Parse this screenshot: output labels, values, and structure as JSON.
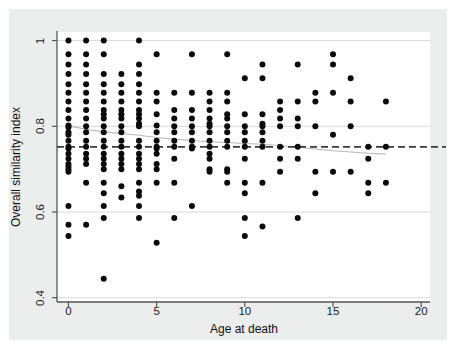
{
  "figure": {
    "background_color": "#eceded",
    "plot_background_color": "#ffffff",
    "axis_color": "#555555",
    "gridline_color": "#d9d9d9",
    "marker_color": "#0b0b0b",
    "reference_line_color": "#3b3b3b",
    "fit_line_color": "#b9b9b9"
  },
  "chart_data": {
    "type": "scatter",
    "title": "",
    "xlabel": "Age at death",
    "ylabel": "Overall similarity index",
    "xlim": [
      -0.65,
      20.5
    ],
    "ylim": [
      0.39,
      1.02
    ],
    "xticks": [
      0,
      5,
      10,
      15,
      20
    ],
    "xtick_labels": [
      "0",
      "5",
      "10",
      "15",
      "20"
    ],
    "yticks": [
      0.4,
      0.6,
      0.8,
      1
    ],
    "ytick_labels": [
      "0.4",
      "0.6",
      "0.8",
      "1"
    ],
    "grid": "horizontal",
    "gridline_values": [
      0.4,
      0.6,
      0.8,
      1.0
    ],
    "legend": "none",
    "marker": "filled-circle",
    "marker_size_px": 6,
    "annotations": [
      {
        "name": "reference-line",
        "type": "horizontal-dashed-line",
        "y": 0.752,
        "style": "dashed"
      },
      {
        "name": "fit-line",
        "type": "lowess-line",
        "style": "solid-thin-gray",
        "points": [
          [
            0.0,
            0.801
          ],
          [
            1.0,
            0.793
          ],
          [
            2.0,
            0.787
          ],
          [
            3.0,
            0.783
          ],
          [
            4.0,
            0.779
          ],
          [
            5.0,
            0.774
          ],
          [
            6.0,
            0.77
          ],
          [
            7.0,
            0.767
          ],
          [
            8.0,
            0.764
          ],
          [
            9.0,
            0.762
          ],
          [
            10.0,
            0.76
          ],
          [
            11.0,
            0.758
          ],
          [
            12.0,
            0.755
          ],
          [
            13.0,
            0.751
          ],
          [
            14.0,
            0.747
          ],
          [
            15.0,
            0.743
          ],
          [
            16.0,
            0.74
          ],
          [
            17.0,
            0.737
          ],
          [
            18.0,
            0.735
          ]
        ]
      }
    ],
    "points": [
      [
        0,
        1.0
      ],
      [
        0,
        0.968
      ],
      [
        0,
        0.944
      ],
      [
        0,
        0.922
      ],
      [
        0,
        0.898
      ],
      [
        0,
        0.878
      ],
      [
        0,
        0.858
      ],
      [
        0,
        0.838
      ],
      [
        0,
        0.818
      ],
      [
        0,
        0.802
      ],
      [
        0,
        0.798
      ],
      [
        0,
        0.786
      ],
      [
        0,
        0.78
      ],
      [
        0,
        0.766
      ],
      [
        0,
        0.752
      ],
      [
        0,
        0.748
      ],
      [
        0,
        0.736
      ],
      [
        0,
        0.724
      ],
      [
        0,
        0.712
      ],
      [
        0,
        0.706
      ],
      [
        0,
        0.7
      ],
      [
        0,
        0.694
      ],
      [
        0,
        0.614
      ],
      [
        0,
        0.57
      ],
      [
        0,
        0.544
      ],
      [
        1,
        1.0
      ],
      [
        1,
        0.968
      ],
      [
        1,
        0.944
      ],
      [
        1,
        0.922
      ],
      [
        1,
        0.898
      ],
      [
        1,
        0.878
      ],
      [
        1,
        0.858
      ],
      [
        1,
        0.838
      ],
      [
        1,
        0.818
      ],
      [
        1,
        0.8
      ],
      [
        1,
        0.786
      ],
      [
        1,
        0.766
      ],
      [
        1,
        0.752
      ],
      [
        1,
        0.736
      ],
      [
        1,
        0.724
      ],
      [
        1,
        0.712
      ],
      [
        1,
        0.668
      ],
      [
        1,
        0.57
      ],
      [
        2,
        1.0
      ],
      [
        2,
        0.968
      ],
      [
        2,
        0.922
      ],
      [
        2,
        0.898
      ],
      [
        2,
        0.878
      ],
      [
        2,
        0.858
      ],
      [
        2,
        0.838
      ],
      [
        2,
        0.828
      ],
      [
        2,
        0.818
      ],
      [
        2,
        0.8
      ],
      [
        2,
        0.786
      ],
      [
        2,
        0.766
      ],
      [
        2,
        0.752
      ],
      [
        2,
        0.736
      ],
      [
        2,
        0.724
      ],
      [
        2,
        0.712
      ],
      [
        2,
        0.7
      ],
      [
        2,
        0.668
      ],
      [
        2,
        0.644
      ],
      [
        2,
        0.614
      ],
      [
        2,
        0.586
      ],
      [
        2,
        0.444
      ],
      [
        3,
        0.922
      ],
      [
        3,
        0.898
      ],
      [
        3,
        0.878
      ],
      [
        3,
        0.858
      ],
      [
        3,
        0.838
      ],
      [
        3,
        0.828
      ],
      [
        3,
        0.818
      ],
      [
        3,
        0.8
      ],
      [
        3,
        0.786
      ],
      [
        3,
        0.766
      ],
      [
        3,
        0.752
      ],
      [
        3,
        0.736
      ],
      [
        3,
        0.724
      ],
      [
        3,
        0.712
      ],
      [
        3,
        0.7
      ],
      [
        3,
        0.66
      ],
      [
        3,
        0.634
      ],
      [
        4,
        1.0
      ],
      [
        4,
        0.944
      ],
      [
        4,
        0.922
      ],
      [
        4,
        0.898
      ],
      [
        4,
        0.878
      ],
      [
        4,
        0.858
      ],
      [
        4,
        0.838
      ],
      [
        4,
        0.828
      ],
      [
        4,
        0.818
      ],
      [
        4,
        0.806
      ],
      [
        4,
        0.8
      ],
      [
        4,
        0.766
      ],
      [
        4,
        0.752
      ],
      [
        4,
        0.736
      ],
      [
        4,
        0.724
      ],
      [
        4,
        0.712
      ],
      [
        4,
        0.7
      ],
      [
        4,
        0.668
      ],
      [
        4,
        0.648
      ],
      [
        4,
        0.638
      ],
      [
        4,
        0.614
      ],
      [
        4,
        0.586
      ],
      [
        5,
        0.968
      ],
      [
        5,
        0.878
      ],
      [
        5,
        0.858
      ],
      [
        5,
        0.828
      ],
      [
        5,
        0.802
      ],
      [
        5,
        0.786
      ],
      [
        5,
        0.766
      ],
      [
        5,
        0.752
      ],
      [
        5,
        0.748
      ],
      [
        5,
        0.736
      ],
      [
        5,
        0.712
      ],
      [
        5,
        0.7
      ],
      [
        5,
        0.668
      ],
      [
        5,
        0.528
      ],
      [
        6,
        0.878
      ],
      [
        6,
        0.838
      ],
      [
        6,
        0.818
      ],
      [
        6,
        0.8
      ],
      [
        6,
        0.786
      ],
      [
        6,
        0.766
      ],
      [
        6,
        0.752
      ],
      [
        6,
        0.724
      ],
      [
        6,
        0.668
      ],
      [
        6,
        0.586
      ],
      [
        7,
        0.968
      ],
      [
        7,
        0.878
      ],
      [
        7,
        0.838
      ],
      [
        7,
        0.818
      ],
      [
        7,
        0.8
      ],
      [
        7,
        0.786
      ],
      [
        7,
        0.766
      ],
      [
        7,
        0.752
      ],
      [
        7,
        0.748
      ],
      [
        7,
        0.614
      ],
      [
        8,
        0.878
      ],
      [
        8,
        0.858
      ],
      [
        8,
        0.838
      ],
      [
        8,
        0.818
      ],
      [
        8,
        0.806
      ],
      [
        8,
        0.8
      ],
      [
        8,
        0.786
      ],
      [
        8,
        0.766
      ],
      [
        8,
        0.752
      ],
      [
        8,
        0.736
      ],
      [
        8,
        0.724
      ],
      [
        8,
        0.7
      ],
      [
        8,
        0.694
      ],
      [
        9,
        0.968
      ],
      [
        9,
        0.878
      ],
      [
        9,
        0.858
      ],
      [
        9,
        0.828
      ],
      [
        9,
        0.818
      ],
      [
        9,
        0.8
      ],
      [
        9,
        0.786
      ],
      [
        9,
        0.766
      ],
      [
        9,
        0.752
      ],
      [
        9,
        0.7
      ],
      [
        9,
        0.694
      ],
      [
        9,
        0.668
      ],
      [
        10,
        0.912
      ],
      [
        10,
        0.828
      ],
      [
        10,
        0.8
      ],
      [
        10,
        0.786
      ],
      [
        10,
        0.766
      ],
      [
        10,
        0.752
      ],
      [
        10,
        0.724
      ],
      [
        10,
        0.668
      ],
      [
        10,
        0.644
      ],
      [
        10,
        0.586
      ],
      [
        10,
        0.544
      ],
      [
        11,
        0.944
      ],
      [
        11,
        0.912
      ],
      [
        11,
        0.828
      ],
      [
        11,
        0.806
      ],
      [
        11,
        0.8
      ],
      [
        11,
        0.786
      ],
      [
        11,
        0.766
      ],
      [
        11,
        0.752
      ],
      [
        11,
        0.668
      ],
      [
        11,
        0.566
      ],
      [
        12,
        0.858
      ],
      [
        12,
        0.838
      ],
      [
        12,
        0.818
      ],
      [
        12,
        0.8
      ],
      [
        12,
        0.752
      ],
      [
        12,
        0.724
      ],
      [
        12,
        0.694
      ],
      [
        13,
        0.944
      ],
      [
        13,
        0.858
      ],
      [
        13,
        0.818
      ],
      [
        13,
        0.8
      ],
      [
        13,
        0.752
      ],
      [
        13,
        0.724
      ],
      [
        13,
        0.586
      ],
      [
        14,
        0.878
      ],
      [
        14,
        0.858
      ],
      [
        14,
        0.8
      ],
      [
        14,
        0.694
      ],
      [
        14,
        0.644
      ],
      [
        15,
        0.968
      ],
      [
        15,
        0.944
      ],
      [
        15,
        0.878
      ],
      [
        15,
        0.78
      ],
      [
        15,
        0.694
      ],
      [
        16,
        0.912
      ],
      [
        16,
        0.858
      ],
      [
        16,
        0.8
      ],
      [
        16,
        0.694
      ],
      [
        17,
        0.752
      ],
      [
        17,
        0.724
      ],
      [
        17,
        0.668
      ],
      [
        17,
        0.644
      ],
      [
        18,
        0.858
      ],
      [
        18,
        0.752
      ],
      [
        18,
        0.668
      ]
    ]
  }
}
